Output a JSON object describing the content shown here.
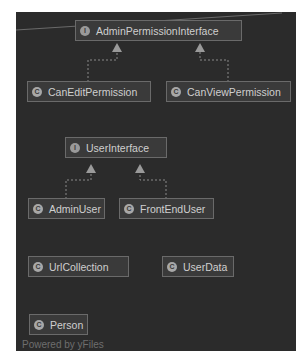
{
  "diagram": {
    "type": "class-hierarchy",
    "watermark": "Powered by yFiles",
    "colors": {
      "canvas_bg": "#2b2b2b",
      "node_bg": "#3a3a3a",
      "node_border": "#6a6a6a",
      "node_text": "#cfcfcf",
      "edge": "#8a8a8a"
    },
    "nodes": [
      {
        "id": "admin_perm_iface",
        "label": "AdminPermissionInterface",
        "kind": "interface",
        "icon": "interface-icon"
      },
      {
        "id": "can_edit",
        "label": "CanEditPermission",
        "kind": "class",
        "icon": "class-icon"
      },
      {
        "id": "can_view",
        "label": "CanViewPermission",
        "kind": "class",
        "icon": "class-icon"
      },
      {
        "id": "user_iface",
        "label": "UserInterface",
        "kind": "interface",
        "icon": "interface-icon"
      },
      {
        "id": "admin_user",
        "label": "AdminUser",
        "kind": "class",
        "icon": "class-icon"
      },
      {
        "id": "frontend_user",
        "label": "FrontEndUser",
        "kind": "class",
        "icon": "class-icon"
      },
      {
        "id": "url_collection",
        "label": "UrlCollection",
        "kind": "class",
        "icon": "class-icon"
      },
      {
        "id": "user_data",
        "label": "UserData",
        "kind": "class",
        "icon": "class-icon"
      },
      {
        "id": "person",
        "label": "Person",
        "kind": "class",
        "icon": "class-icon"
      }
    ],
    "edges": [
      {
        "from": "can_edit",
        "to": "admin_perm_iface",
        "style": "dashed",
        "arrow": "hollow-triangle",
        "relation": "implements"
      },
      {
        "from": "can_view",
        "to": "admin_perm_iface",
        "style": "dashed",
        "arrow": "hollow-triangle",
        "relation": "implements"
      },
      {
        "from": "admin_user",
        "to": "user_iface",
        "style": "dashed",
        "arrow": "hollow-triangle",
        "relation": "implements"
      },
      {
        "from": "frontend_user",
        "to": "user_iface",
        "style": "dashed",
        "arrow": "hollow-triangle",
        "relation": "implements"
      }
    ]
  }
}
